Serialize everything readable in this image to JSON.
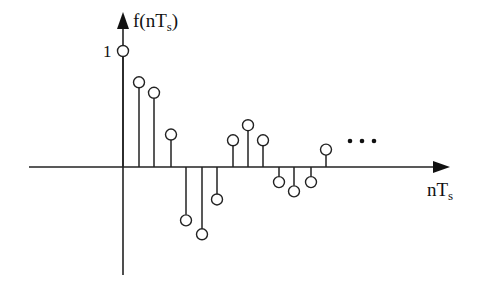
{
  "chart_data": {
    "type": "stem",
    "title": "",
    "xlabel": "nT_s",
    "ylabel": "f(nT_s)",
    "ytick_labels": [
      "1"
    ],
    "x": [
      0,
      1,
      2,
      3,
      4,
      5,
      6,
      7,
      8,
      9,
      10,
      11,
      12,
      13
    ],
    "values": [
      1.0,
      0.73,
      0.64,
      0.28,
      -0.46,
      -0.58,
      -0.28,
      0.23,
      0.36,
      0.23,
      -0.13,
      -0.21,
      -0.13,
      0.15
    ],
    "continuation": "...",
    "marker": "open-circle",
    "grid": false,
    "ylim": [
      -0.95,
      1.3
    ]
  },
  "labels": {
    "y_axis_func": "f(nT",
    "y_axis_sub": "s",
    "y_axis_close": ")",
    "x_axis_main": "nT",
    "x_axis_sub": "s",
    "unit_tick": "1"
  },
  "layout": {
    "origin_x": 123,
    "axis_y": 167,
    "unit_px": 116,
    "stem_x": [
      123,
      139,
      154,
      171,
      186,
      202,
      217,
      233,
      248,
      263,
      279,
      294,
      311,
      326
    ],
    "dots_x": [
      350,
      362,
      374
    ],
    "dots_y": 141,
    "color": "#222222"
  }
}
